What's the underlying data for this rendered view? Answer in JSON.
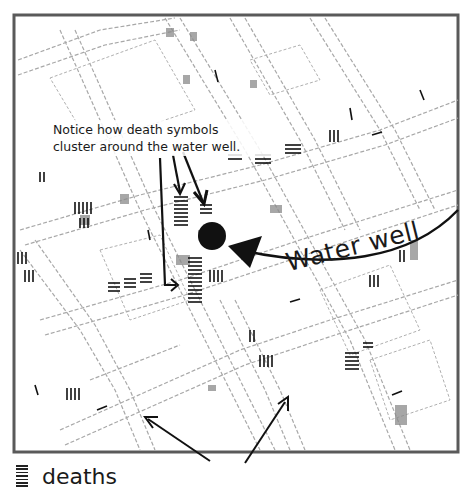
{
  "annotation": {
    "line1": "Notice how death symbols",
    "line2": "cluster around the water well."
  },
  "water_well_label": "Water well",
  "legend": {
    "icon": "death-tally-marks-icon",
    "label": "deaths"
  },
  "map": {
    "street_labels_visible": [
      "BOROUGH",
      "WORK HOUSE",
      "BROAD STREET",
      "HERTFORD MEWS"
    ],
    "frame_color": "#555555",
    "street_color": "#9a9a9a",
    "marker_color": "#111111"
  }
}
